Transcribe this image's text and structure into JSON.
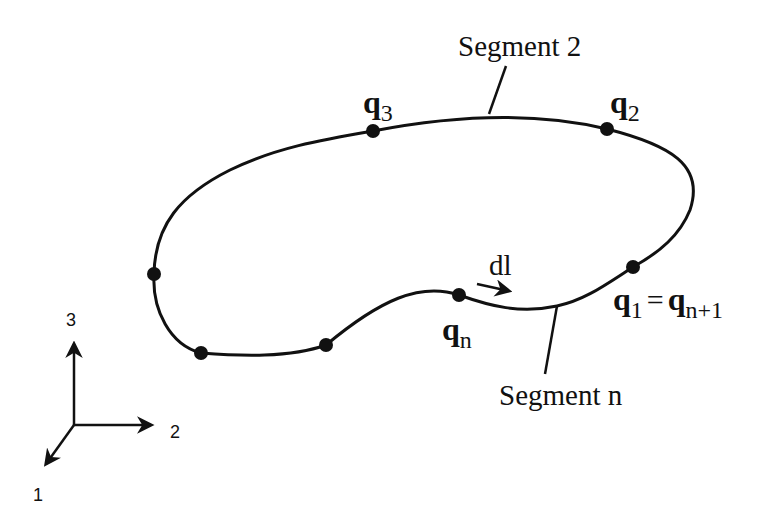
{
  "diagram": {
    "type": "closed-curve-segmentation",
    "curve": {
      "nodes": [
        {
          "id": "q3",
          "label": "q",
          "sub": "3",
          "x": 373,
          "y": 131
        },
        {
          "id": "q2",
          "label": "q",
          "sub": "2",
          "x": 607,
          "y": 129
        },
        {
          "id": "q1",
          "label": "q",
          "sub": "1",
          "x": 633,
          "y": 267
        },
        {
          "id": "qn",
          "label": "q",
          "sub": "n",
          "x": 459,
          "y": 295
        },
        {
          "id": "p5",
          "x": 326,
          "y": 345
        },
        {
          "id": "p6",
          "x": 201,
          "y": 353
        },
        {
          "id": "p7",
          "x": 154,
          "y": 274
        }
      ]
    },
    "labels": {
      "segment2": "Segment 2",
      "segmentn": "Segment n",
      "q3": {
        "main": "q",
        "sub": "3"
      },
      "q2": {
        "main": "q",
        "sub": "2"
      },
      "qn": {
        "main": "q",
        "sub": "n"
      },
      "q1_eq": {
        "main1": "q",
        "sub1": "1",
        "eq": "=",
        "main2": "q",
        "sub2": "n+1"
      },
      "dl": "dl"
    },
    "axes": {
      "axis1": "1",
      "axis2": "2",
      "axis3": "3"
    }
  }
}
